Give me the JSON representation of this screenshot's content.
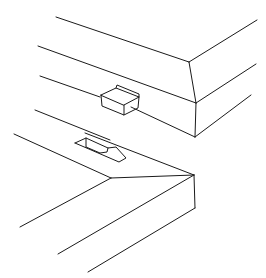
{
  "figure": {
    "type": "patent line drawing",
    "stroke_color": "#1a1a1a",
    "background": "#ffffff"
  },
  "parts": [
    {
      "name": "upper-housing",
      "feature": "protruding tab"
    },
    {
      "name": "lower-housing",
      "feature": "recessed slot"
    }
  ]
}
